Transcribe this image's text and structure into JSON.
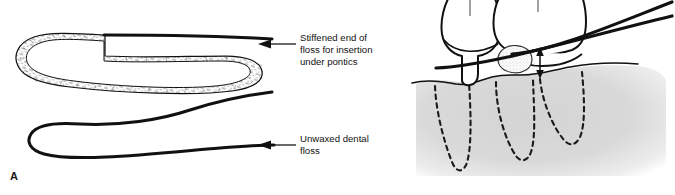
{
  "figure": {
    "type": "dental-illustration",
    "background_color": "#ffffff",
    "width": 675,
    "height": 195
  },
  "panels": [
    {
      "letter": "A",
      "name": "floss-threader-diagram",
      "callouts": [
        {
          "id": "stiffened-end",
          "text": "Stiffened end of\nfloss for insertion\nunder pontics",
          "arrow_direction": "left"
        },
        {
          "id": "unwaxed-floss",
          "text": "Unwaxed dental\nfloss",
          "arrow_direction": "left"
        }
      ],
      "elements": [
        {
          "name": "stiffened-threader-loop",
          "style": "textured-outline"
        },
        {
          "name": "unwaxed-floss-strand",
          "style": "solid-thick-line"
        }
      ]
    },
    {
      "letter": "B",
      "name": "pontic-flossing-diagram",
      "callouts": [],
      "elements": [
        {
          "name": "abutment-tooth-crown",
          "style": "outline"
        },
        {
          "name": "pontic-crown",
          "style": "outline"
        },
        {
          "name": "plaque-deposit",
          "style": "stippled"
        },
        {
          "name": "gingiva-shading",
          "color": "#d9d9d9"
        },
        {
          "name": "tooth-roots-dashed",
          "style": "dashed-outline",
          "count": 3
        },
        {
          "name": "floss-strands",
          "style": "solid-thick-line",
          "count": 2
        },
        {
          "name": "clearance-double-arrow",
          "style": "double-headed-vertical"
        }
      ]
    }
  ],
  "colors": {
    "ink": "#111111",
    "gingiva_gray": "#d9d9d9",
    "paper": "#ffffff"
  }
}
